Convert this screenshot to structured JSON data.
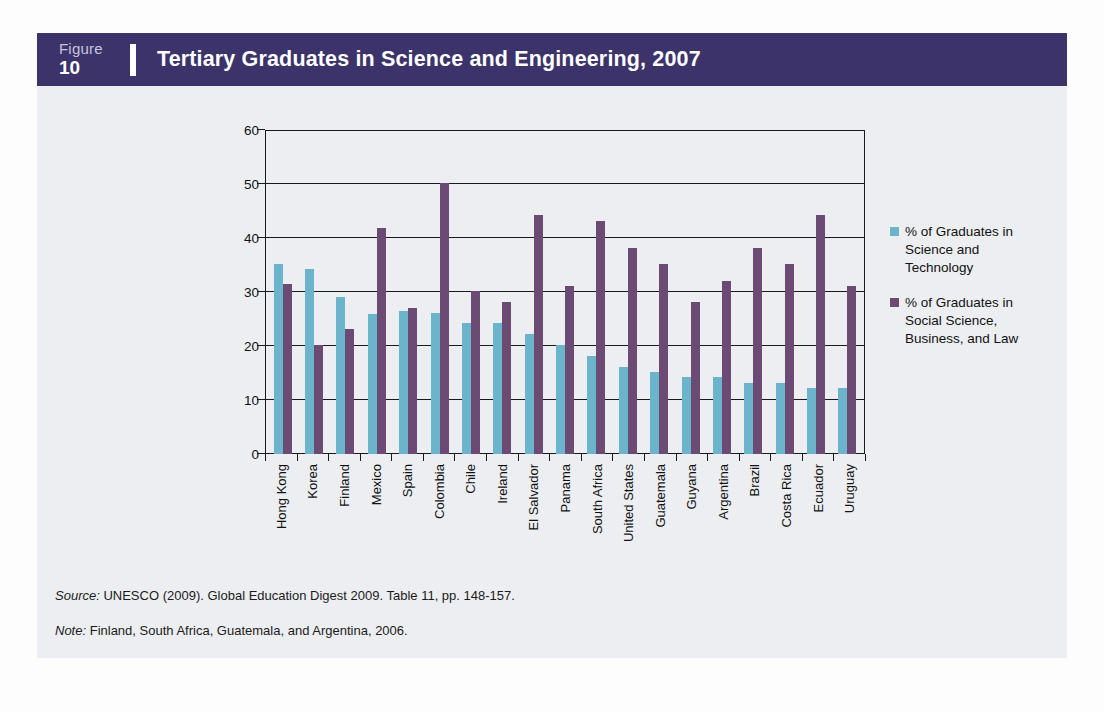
{
  "header": {
    "figure_word": "Figure",
    "figure_number": "10",
    "title": "Tertiary Graduates in Science and Engineering, 2007"
  },
  "colors": {
    "header_bg": "#3b3369",
    "panel_bg": "#eceef1",
    "series_science": "#6cb4cc",
    "series_social": "#6b4a73",
    "axis": "#1a1a1a"
  },
  "legend": {
    "items": [
      {
        "color_key": "series_science",
        "label": "% of Graduates in Science and Technology"
      },
      {
        "color_key": "series_social",
        "label": "% of Graduates in Social Science, Business, and Law"
      }
    ]
  },
  "footnotes": {
    "source_lead": "Source:",
    "source_text": " UNESCO (2009). Global Education Digest 2009. Table 11, pp. 148-157.",
    "note_lead": "Note:",
    "note_text": " Finland, South Africa, Guatemala, and Argentina, 2006."
  },
  "chart_data": {
    "type": "bar",
    "title": "Tertiary Graduates in Science and Engineering, 2007",
    "xlabel": "",
    "ylabel": "Percent of total tertiary graduates",
    "ylim": [
      0,
      60
    ],
    "yticks": [
      0,
      10,
      20,
      30,
      40,
      50,
      60
    ],
    "ytick_labels": [
      "0",
      "10",
      "20",
      "30",
      "40",
      "50",
      "60"
    ],
    "grid": true,
    "legend_position": "right",
    "categories": [
      "Hong Kong",
      "Korea",
      "Finland",
      "Mexico",
      "Spain",
      "Colombia",
      "Chile",
      "Ireland",
      "El Salvador",
      "Panama",
      "South Africa",
      "United States",
      "Guatemala",
      "Guyana",
      "Argentina",
      "Brazil",
      "Costa Rica",
      "Ecuador",
      "Uruguay"
    ],
    "series": [
      {
        "name": "% of Graduates in Science and Technology",
        "color": "#6cb4cc",
        "values": [
          35.2,
          34.2,
          29.0,
          26.0,
          26.4,
          26.1,
          24.2,
          24.2,
          22.3,
          20.1,
          18.2,
          16.1,
          15.2,
          14.3,
          14.3,
          13.2,
          13.2,
          12.3,
          12.2
        ]
      },
      {
        "name": "% of Graduates in Social Science, Business, and Law",
        "color": "#6b4a73",
        "values": [
          31.4,
          20.2,
          23.2,
          41.9,
          27.0,
          50.1,
          30.1,
          28.1,
          44.2,
          31.1,
          43.2,
          38.2,
          35.1,
          28.2,
          32.1,
          38.2,
          35.2,
          44.3,
          31.1
        ]
      }
    ]
  }
}
